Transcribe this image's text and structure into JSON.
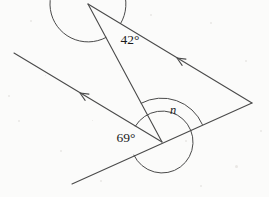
{
  "figure": {
    "background_color": "#fbfbfa",
    "stroke_color": "#4a4a4a",
    "text_color": "#1a1a1a",
    "stroke_width": 1.1
  },
  "labels": {
    "angle_top": "42°",
    "angle_bottom_left": "69°",
    "angle_unknown": "n"
  },
  "label_positions": {
    "angle_top": {
      "x": 130,
      "y": 41
    },
    "angle_bottom_left": {
      "x": 126,
      "y": 139
    },
    "angle_unknown": {
      "x": 173,
      "y": 111
    }
  },
  "points": {
    "apex": {
      "x": 88,
      "y": 4
    },
    "right_vertex": {
      "x": 252,
      "y": 103
    },
    "bottom_vertex": {
      "x": 162,
      "y": 142
    },
    "left_ray_end": {
      "x": 14,
      "y": 53
    },
    "bottom_line_left_end": {
      "x": 72,
      "y": 184
    },
    "bottom_line_right_end": {
      "x": 252,
      "y": 103
    }
  },
  "segments": [
    {
      "name": "apex-to-right-vertex",
      "from": "apex",
      "to": "right_vertex",
      "has_arrow": true,
      "arrow_at": {
        "x": 177,
        "y": 58
      }
    },
    {
      "name": "apex-to-bottom-vertex",
      "from": "apex",
      "to": "bottom_vertex",
      "has_arrow": false
    },
    {
      "name": "bottom-vertex-to-left-ray-end",
      "from": "bottom_vertex",
      "to": "left_ray_end",
      "has_arrow": true,
      "arrow_at": {
        "x": 80,
        "y": 93
      }
    },
    {
      "name": "bottom-line",
      "from": "bottom_line_left_end",
      "to": "bottom_line_right_end",
      "has_arrow": false
    }
  ],
  "arcs": [
    {
      "name": "arc-42",
      "center": "apex",
      "radius": 38,
      "label": "42°"
    },
    {
      "name": "arc-69",
      "center": "bottom_vertex",
      "radius": 31,
      "label": "69°"
    },
    {
      "name": "arc-n",
      "center": "bottom_vertex",
      "radius": 44,
      "label": "n"
    }
  ],
  "arrow_markers": {
    "count": 2,
    "style": "open-chevron",
    "meaning": "parallel-lines"
  }
}
